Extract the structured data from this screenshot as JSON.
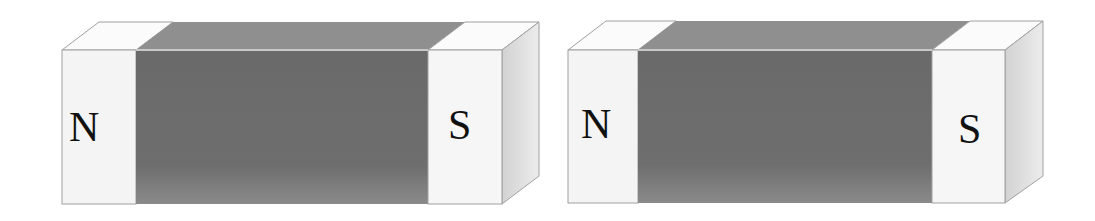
{
  "diagram": {
    "colors": {
      "background": "#ffffff",
      "pole_front": "#f4f4f4",
      "pole_top": "#fbfbfb",
      "pole_side": "#dcdcdc",
      "center_front": "#6e6e6e",
      "center_front_bottom": "#888888",
      "center_top": "#8f8f8f",
      "outline": "#9a9a9a",
      "label": "#111111"
    },
    "magnets": [
      {
        "id": "magnet-1",
        "left_pole": "N",
        "right_pole": "S"
      },
      {
        "id": "magnet-2",
        "left_pole": "N",
        "right_pole": "S"
      }
    ]
  }
}
